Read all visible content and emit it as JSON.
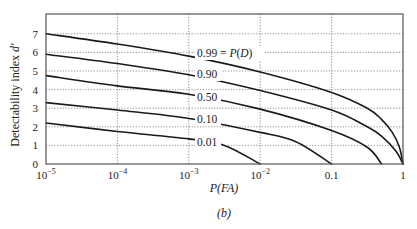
{
  "chart_data": {
    "type": "line",
    "title": "",
    "caption": "(b)",
    "xlabel": "P(FA)",
    "ylabel": "Detectability index d′",
    "x_scale": "log",
    "xlim": [
      1e-05,
      1
    ],
    "ylim": [
      0,
      7.6
    ],
    "grid": true,
    "legend_position": "inline labels",
    "x_ticks": [
      {
        "value": 1e-05,
        "base": "10",
        "exp": "−5"
      },
      {
        "value": 0.0001,
        "base": "10",
        "exp": "−4"
      },
      {
        "value": 0.001,
        "base": "10",
        "exp": "−3"
      },
      {
        "value": 0.01,
        "base": "10",
        "exp": "−2"
      },
      {
        "value": 0.1,
        "base": "0.1",
        "exp": ""
      },
      {
        "value": 1,
        "base": "1",
        "exp": ""
      }
    ],
    "y_ticks": [
      0,
      1,
      2,
      3,
      4,
      5,
      6,
      7
    ],
    "series": [
      {
        "name": "0.99",
        "label": "0.99 = P(D)",
        "x": [
          1e-05,
          0.0001,
          0.001,
          0.01,
          0.1,
          0.316,
          0.5,
          0.708,
          0.891,
          1
        ],
        "values": [
          7.0,
          6.45,
          5.8,
          4.95,
          3.85,
          3.0,
          2.4,
          1.7,
          0.9,
          0
        ]
      },
      {
        "name": "0.90",
        "label": "0.90",
        "x": [
          1e-05,
          0.0001,
          0.001,
          0.01,
          0.1,
          0.316,
          0.5,
          0.794,
          1
        ],
        "values": [
          5.9,
          5.4,
          4.8,
          3.95,
          2.9,
          2.0,
          1.5,
          0.7,
          0
        ]
      },
      {
        "name": "0.50",
        "label": "0.50",
        "x": [
          1e-05,
          0.0001,
          0.001,
          0.01,
          0.1,
          0.316,
          0.5
        ],
        "values": [
          4.75,
          4.2,
          3.75,
          2.95,
          1.8,
          0.9,
          0
        ]
      },
      {
        "name": "0.10",
        "label": "0.10",
        "x": [
          1e-05,
          0.0001,
          0.001,
          0.01,
          0.0316,
          0.1
        ],
        "values": [
          3.3,
          2.9,
          2.45,
          1.7,
          1.2,
          0
        ]
      },
      {
        "name": "0.01",
        "label": "0.01",
        "x": [
          1e-05,
          0.0001,
          0.001,
          0.00316,
          0.01
        ],
        "values": [
          2.2,
          1.75,
          1.35,
          1.0,
          0
        ]
      }
    ]
  },
  "layout": {
    "plot": {
      "left": 46,
      "right": 403,
      "top": 14,
      "bottom": 164
    },
    "y_px_per_unit": 18.6,
    "label_x": 197,
    "label_y": [
      57,
      78,
      101,
      123,
      146
    ]
  }
}
